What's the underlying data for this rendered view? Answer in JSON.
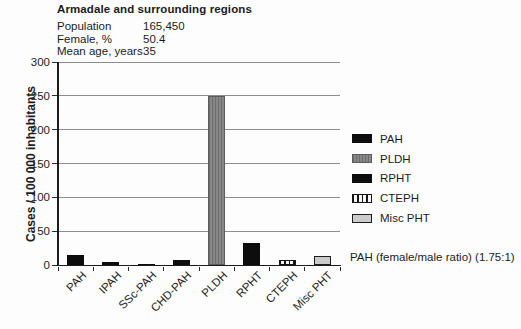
{
  "header": {
    "title": "Armadale and surrounding regions",
    "stats": [
      {
        "label": "Population",
        "value": "165,450"
      },
      {
        "label": "Female, %",
        "value": "50.4"
      },
      {
        "label": "Mean age, years",
        "value": "35"
      }
    ]
  },
  "chart_data": {
    "type": "bar",
    "title": "",
    "xlabel": "",
    "ylabel": "Cases / 100 000 inhabitants",
    "ylim": [
      0,
      300
    ],
    "yticks": [
      0,
      50,
      100,
      150,
      200,
      250,
      300
    ],
    "grid": true,
    "categories": [
      "PAH",
      "IPAH",
      "SSc-PAH",
      "CHD-PAH",
      "PLDH",
      "RPHT",
      "CTEPH",
      "Misc PHT"
    ],
    "values": [
      15,
      5,
      2,
      7,
      250,
      33,
      8,
      13
    ],
    "bar_styles": [
      "black",
      "black",
      "black",
      "black",
      "gray-striped",
      "black",
      "hatch-vertical",
      "light-gray"
    ],
    "legend": {
      "position": "right",
      "entries": [
        {
          "label": "PAH",
          "style": "black"
        },
        {
          "label": "PLDH",
          "style": "gray-striped"
        },
        {
          "label": "RPHT",
          "style": "black"
        },
        {
          "label": "CTEPH",
          "style": "hatch-vertical"
        },
        {
          "label": "Misc PHT",
          "style": "light-gray"
        }
      ]
    },
    "annotation": "PAH (female/male ratio) (1.75:1)"
  },
  "colors": {
    "bar_black": "#0d0d0d",
    "bar_gray": "#7b7b7b",
    "bar_light_gray": "#cbcbcb",
    "grid_line": "#8d8d8d",
    "axis": "#1c1c1c",
    "text": "#1c1c1c"
  }
}
